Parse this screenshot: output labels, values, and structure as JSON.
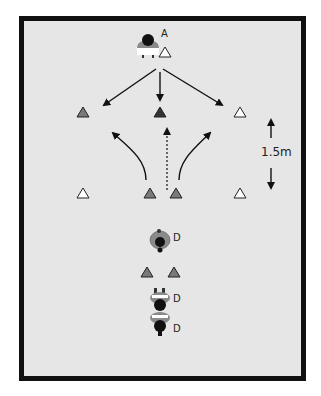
{
  "diagram": {
    "type": "football drill diagram",
    "background_color": "#e6e6e6",
    "border_color": "#111111",
    "players": [
      {
        "label": "A",
        "role": "attacker",
        "x": 148,
        "y": 44,
        "facing": "down"
      },
      {
        "label": "D",
        "role": "defender",
        "x": 160,
        "y": 240,
        "facing": "up"
      },
      {
        "label": "D",
        "role": "defender",
        "x": 160,
        "y": 297,
        "facing": "down"
      },
      {
        "label": "D",
        "role": "defender",
        "x": 160,
        "y": 325,
        "facing": "down"
      }
    ],
    "cones": [
      {
        "x": 165,
        "y": 52,
        "color": "white"
      },
      {
        "x": 83,
        "y": 112,
        "color": "grey"
      },
      {
        "x": 160,
        "y": 112,
        "color": "dark"
      },
      {
        "x": 240,
        "y": 112,
        "color": "white"
      },
      {
        "x": 83,
        "y": 193,
        "color": "white"
      },
      {
        "x": 150,
        "y": 193,
        "color": "grey"
      },
      {
        "x": 176,
        "y": 193,
        "color": "grey"
      },
      {
        "x": 240,
        "y": 193,
        "color": "white"
      },
      {
        "x": 147,
        "y": 272,
        "color": "grey"
      },
      {
        "x": 174,
        "y": 272,
        "color": "grey"
      }
    ],
    "cone_colors": {
      "white": "#ffffff",
      "grey": "#7a7a7a",
      "dark": "#333333"
    },
    "arrows": [
      {
        "type": "solid",
        "from": [
          156,
          69
        ],
        "to": [
          104,
          105
        ]
      },
      {
        "type": "solid",
        "from": [
          160,
          72
        ],
        "to": [
          160,
          100
        ]
      },
      {
        "type": "solid",
        "from": [
          163,
          69
        ],
        "to": [
          222,
          105
        ]
      },
      {
        "type": "curved",
        "from": [
          146,
          180
        ],
        "to": [
          113,
          133
        ]
      },
      {
        "type": "curved",
        "from": [
          179,
          180
        ],
        "to": [
          210,
          133
        ]
      },
      {
        "type": "dotted",
        "from": [
          167,
          190
        ],
        "to": [
          167,
          128
        ]
      }
    ],
    "measurement": {
      "label": "1.5m",
      "x": 271,
      "y_top": 118,
      "y_bottom": 190
    }
  }
}
